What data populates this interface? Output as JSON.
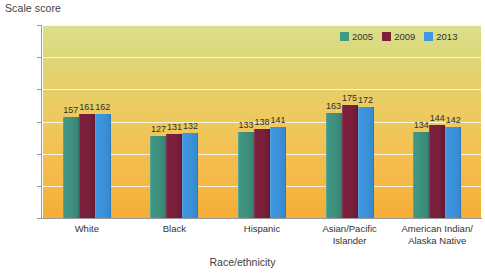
{
  "chart_data": {
    "type": "bar",
    "title": "",
    "ylabel": "Scale score",
    "xlabel": "Race/ethnicity",
    "ylim": [
      0,
      300
    ],
    "yticks": [
      0,
      50,
      100,
      150,
      200,
      250,
      300
    ],
    "grid": true,
    "legend_position": "top-right",
    "categories": [
      "White",
      "Black",
      "Hispanic",
      "Asian/Pacific Islander",
      "American Indian/ Alaska Native"
    ],
    "category_lines": [
      [
        "White"
      ],
      [
        "Black"
      ],
      [
        "Hispanic"
      ],
      [
        "Asian/Pacific",
        "Islander"
      ],
      [
        "American Indian/",
        "Alaska Native"
      ]
    ],
    "series": [
      {
        "name": "2005",
        "color": "#3f9a86",
        "values": [
          157,
          127,
          133,
          163,
          134
        ]
      },
      {
        "name": "2009",
        "color": "#7d1f3d",
        "values": [
          161,
          131,
          138,
          175,
          144
        ]
      },
      {
        "name": "2013",
        "color": "#3f97df",
        "values": [
          162,
          132,
          141,
          172,
          142
        ]
      }
    ]
  },
  "legend": {
    "items": [
      {
        "label": "2005"
      },
      {
        "label": "2009"
      },
      {
        "label": "2013"
      }
    ]
  },
  "colors": {
    "series_2005": "#3f9a86",
    "series_2009": "#7d1f3d",
    "series_2013": "#3f97df",
    "plot_top": "#d9e08a",
    "plot_bottom": "#f4ad36",
    "gridline": "#fdfdf4",
    "axis": "#9b9b9b"
  }
}
